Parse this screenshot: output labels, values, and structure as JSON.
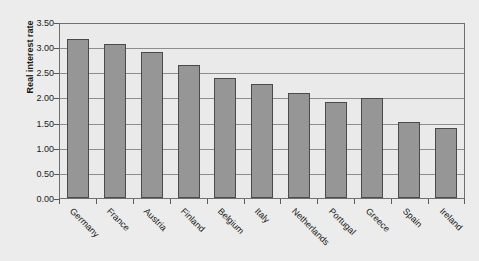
{
  "chart_data": {
    "type": "bar",
    "title": "",
    "xlabel": "",
    "ylabel": "Real interest rate",
    "ylim": [
      0.0,
      3.5
    ],
    "ytick_step": 0.5,
    "grid": true,
    "legend": "none",
    "orientation": "vertical",
    "bar_color": "#969696",
    "bar_border_color": "#4a4a4a",
    "plot_background": "#eaeaea",
    "gridline_color": "#8e8e8e",
    "axis_color": "#707070",
    "page_background": "#ececec",
    "categories": [
      "Germany",
      "France",
      "Austria",
      "Finland",
      "Belgium",
      "Italy",
      "Netherlands",
      "Portugal",
      "Greece",
      "Spain",
      "Ireland"
    ],
    "values": [
      3.17,
      3.07,
      2.9,
      2.64,
      2.38,
      2.26,
      2.08,
      1.9,
      1.98,
      1.52,
      1.4
    ],
    "ytick_labels": [
      "3.50",
      "3.00",
      "2.50",
      "2.00",
      "1.50",
      "1.00",
      "0.50",
      "0.00"
    ],
    "ytick_values": [
      3.5,
      3.0,
      2.5,
      2.0,
      1.5,
      1.0,
      0.5,
      0.0
    ]
  }
}
